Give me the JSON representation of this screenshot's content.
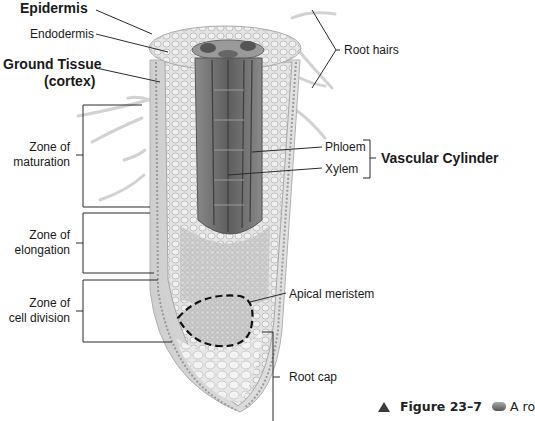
{
  "diagram": {
    "labels": {
      "epidermis": "Epidermis",
      "endodermis": "Endodermis",
      "ground_tissue_line1": "Ground Tissue",
      "ground_tissue_line2": "(cortex)",
      "root_hairs": "Root hairs",
      "phloem": "Phloem",
      "xylem": "Xylem",
      "vascular_cylinder": "Vascular Cylinder",
      "zone_maturation_line1": "Zone of",
      "zone_maturation_line2": "maturation",
      "zone_elongation_line1": "Zone of",
      "zone_elongation_line2": "elongation",
      "zone_division_line1": "Zone of",
      "zone_division_line2": "cell division",
      "apical_meristem": "Apical meristem",
      "root_cap": "Root cap"
    },
    "colors": {
      "tissue_light": "#e6e6e6",
      "tissue_mid": "#cfcfcf",
      "vascular_dark": "#6f6f6f",
      "leader_line": "#2a2a2a",
      "meristem_outline": "#111111"
    }
  },
  "caption": {
    "figure_number": "Figure 23–7",
    "text_start": "A ro"
  }
}
